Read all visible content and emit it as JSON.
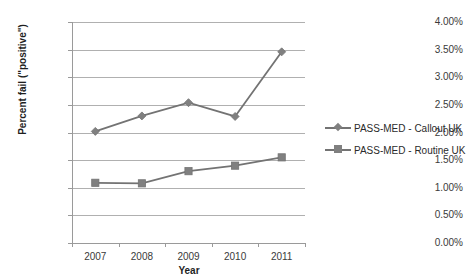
{
  "chart_data": {
    "type": "line",
    "title": "",
    "xlabel": "Year",
    "ylabel": "Percent fail (\"positive\")",
    "categories": [
      "2007",
      "2008",
      "2009",
      "2010",
      "2011"
    ],
    "ylim": [
      0,
      4
    ],
    "ytick_labels": [
      "0.00%",
      "0.50%",
      "1.00%",
      "1.50%",
      "2.00%",
      "2.50%",
      "3.00%",
      "3.50%",
      "4.00%"
    ],
    "ytick_values": [
      0,
      0.5,
      1.0,
      1.5,
      2.0,
      2.5,
      3.0,
      3.5,
      4.0
    ],
    "grid": true,
    "legend_position": "right",
    "series": [
      {
        "name": "PASS-MED - Callout UK",
        "marker": "diamond",
        "color": "#808080",
        "values": [
          2.02,
          2.3,
          2.54,
          2.29,
          3.46
        ]
      },
      {
        "name": "PASS-MED - Routine UK",
        "marker": "square",
        "color": "#808080",
        "values": [
          1.09,
          1.08,
          1.3,
          1.4,
          1.55
        ]
      }
    ]
  },
  "colors": {
    "series": "#808080",
    "line": "#737373",
    "gridline": "#b0b0b0",
    "axis": "#9a9a9a",
    "background": "#ffffff",
    "text": "#2b2b2b"
  }
}
